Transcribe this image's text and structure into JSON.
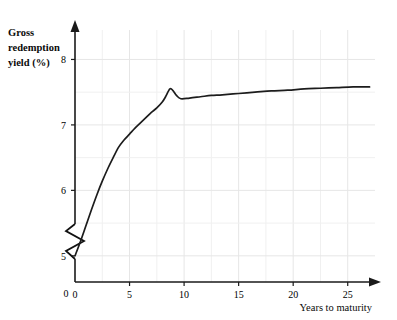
{
  "chart_data": {
    "type": "line",
    "title": "",
    "xlabel": "Years to maturity",
    "ylabel": "Gross redemption yield (%)",
    "ylabel_lines": [
      "Gross",
      "redemption",
      "yield (%)"
    ],
    "xlim": [
      0,
      27.5
    ],
    "ylim": [
      4.6,
      8.45
    ],
    "y_axis_break": true,
    "y_axis_break_note": "zigzag break between 0 and 5",
    "grid": true,
    "legend": null,
    "x_ticks": [
      0,
      5,
      10,
      15,
      20,
      25
    ],
    "x_tick_labels": [
      "0",
      "5",
      "10",
      "15",
      "20",
      "25"
    ],
    "x_minor_ticks": [
      2.5,
      7.5,
      12.5,
      17.5,
      22.5
    ],
    "y_ticks": [
      5,
      6,
      7,
      8
    ],
    "y_tick_labels": [
      "5",
      "6",
      "7",
      "8"
    ],
    "y_origin_label": "0",
    "y_minor_ticks": [
      5.5,
      6.5,
      7.5
    ],
    "series": [
      {
        "name": "Gross redemption yield",
        "color": "#1c1c1c",
        "x": [
          0.0,
          0.5,
          1.0,
          1.5,
          2.0,
          2.5,
          3.0,
          3.5,
          4.0,
          4.5,
          5.0,
          5.5,
          6.0,
          6.5,
          7.0,
          7.5,
          8.0,
          8.3,
          8.7,
          9.0,
          9.3,
          9.7,
          10.5,
          11.5,
          12.5,
          13.5,
          15.0,
          16.5,
          18.0,
          19.5,
          21.0,
          22.5,
          24.0,
          25.5,
          27.0
        ],
        "y": [
          5.0,
          5.22,
          5.46,
          5.7,
          5.93,
          6.14,
          6.33,
          6.5,
          6.66,
          6.77,
          6.86,
          6.95,
          7.03,
          7.11,
          7.19,
          7.26,
          7.35,
          7.43,
          7.55,
          7.52,
          7.45,
          7.4,
          7.41,
          7.43,
          7.45,
          7.46,
          7.48,
          7.5,
          7.52,
          7.53,
          7.55,
          7.56,
          7.57,
          7.58,
          7.58
        ]
      }
    ],
    "annotations": [
      {
        "text": "hump peak",
        "x": 8.7,
        "y": 7.55
      },
      {
        "text": "local minimum",
        "x": 9.7,
        "y": 7.4
      },
      {
        "text": "start of curve",
        "x": 0.0,
        "y": 5.0
      }
    ]
  },
  "axes": {
    "x_axis_name": "years-to-maturity-axis",
    "y_axis_name": "gross-redemption-yield-axis"
  }
}
